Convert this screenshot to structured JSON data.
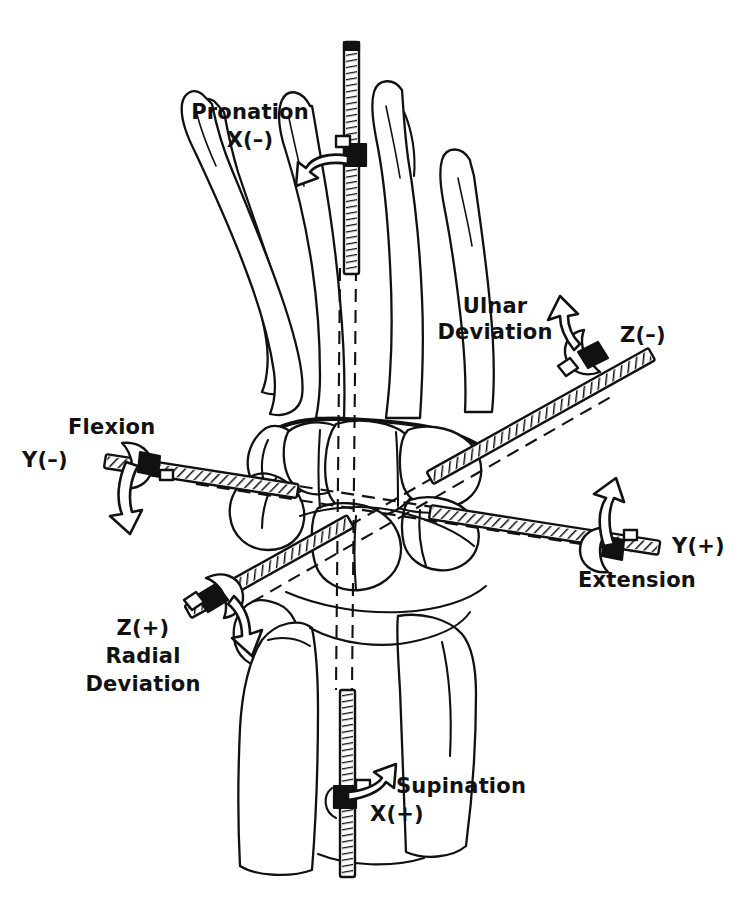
{
  "figure": {
    "style": "black-and-white line drawing",
    "line_color": "#111111",
    "background_color": "#ffffff",
    "origin": {
      "x": 340,
      "y": 500
    }
  },
  "axes": [
    {
      "id": "x",
      "name": "longitudinal-axis",
      "orientation": "vertical",
      "rod_start": {
        "x": 352,
        "y": 42
      },
      "rod_end": {
        "x": 348,
        "y": 877
      },
      "positive": {
        "sign": "X(+)",
        "motion": "Supination",
        "sign_label_pos": {
          "x": 396,
          "y": 806
        },
        "motion_label_pos": {
          "x": 396,
          "y": 778
        },
        "collar": {
          "x": 348,
          "y": 795
        }
      },
      "negative": {
        "sign": "X(-)",
        "motion": "Pronation",
        "sign_label_pos": {
          "x": 250,
          "y": 138
        },
        "motion_label_pos": {
          "x": 250,
          "y": 112
        },
        "collar": {
          "x": 351,
          "y": 152
        }
      }
    },
    {
      "id": "y",
      "name": "flexion-extension-axis",
      "orientation": "oblique-left-to-right",
      "rod_start": {
        "x": 105,
        "y": 461
      },
      "rod_end": {
        "x": 662,
        "y": 548
      },
      "positive": {
        "sign": "Y(+)",
        "motion": "Extension",
        "sign_label_pos": {
          "x": 676,
          "y": 543
        },
        "motion_label_pos": {
          "x": 582,
          "y": 572
        },
        "collar": {
          "x": 616,
          "y": 543
        }
      },
      "negative": {
        "sign": "Y(-)",
        "motion": "Flexion",
        "sign_label_pos": {
          "x": 22,
          "y": 447
        },
        "motion_label_pos": {
          "x": 68,
          "y": 415
        },
        "collar": {
          "x": 133,
          "y": 465
        }
      }
    },
    {
      "id": "z",
      "name": "radial-ulnar-deviation-axis",
      "orientation": "oblique-lower-left-to-upper-right",
      "rod_start": {
        "x": 188,
        "y": 612
      },
      "rod_end": {
        "x": 652,
        "y": 358
      },
      "positive": {
        "sign": "Z(+)",
        "motion": "Radial Deviation",
        "sign_label_pos": {
          "x": 128,
          "y": 627
        },
        "motion_label_pos": {
          "x": 88,
          "y": 652
        },
        "collar": {
          "x": 222,
          "y": 592
        }
      },
      "negative": {
        "sign": "Z(-)",
        "motion": "Ulnar Deviation",
        "sign_label_pos": {
          "x": 620,
          "y": 325
        },
        "motion_label_pos": {
          "x": 500,
          "y": 296
        },
        "collar": {
          "x": 588,
          "y": 378
        }
      }
    }
  ],
  "labels": [
    {
      "key": "pronation",
      "motion": "Pronation",
      "sign": "X(−)"
    },
    {
      "key": "supination",
      "motion": "Supination",
      "sign": "X(+)"
    },
    {
      "key": "flexion",
      "motion": "Flexion",
      "sign": "Y(−)"
    },
    {
      "key": "extension",
      "motion": "Extension",
      "sign": "Y(+)"
    },
    {
      "key": "ulnar",
      "motion": "Ulnar\nDeviation",
      "sign": "Z(−)"
    },
    {
      "key": "radial",
      "motion": "Radial\nDeviation",
      "sign": "Z(+)"
    }
  ],
  "text": {
    "pronation_motion": "Pronation",
    "pronation_sign": "X(–)",
    "supination_motion": "Supination",
    "supination_sign": "X(+)",
    "flexion_motion": "Flexion",
    "flexion_sign": "Y(–)",
    "extension_motion": "Extension",
    "extension_sign": "Y(+)",
    "ulnar_motion_line1": "Ulnar",
    "ulnar_motion_line2": "Deviation",
    "ulnar_sign": "Z(–)",
    "radial_sign": "Z(+)",
    "radial_motion_line1": "Radial",
    "radial_motion_line2": "Deviation"
  },
  "anatomy": {
    "segments": [
      "metacarpal-1",
      "metacarpal-2",
      "metacarpal-3",
      "metacarpal-4",
      "metacarpal-5",
      "trapezium",
      "trapezoid",
      "capitate",
      "hamate",
      "scaphoid",
      "lunate",
      "triquetrum",
      "pisiform",
      "radius",
      "ulna"
    ]
  }
}
